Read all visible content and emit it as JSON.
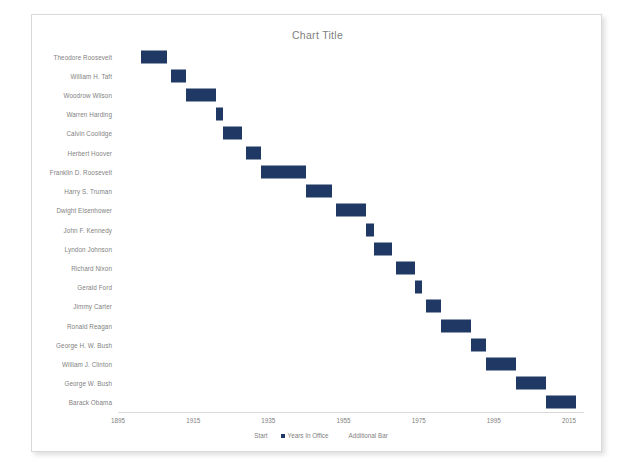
{
  "chart_data": {
    "type": "bar",
    "subtype": "stacked-horizontal-gantt",
    "title": "Chart Title",
    "xlabel": "",
    "ylabel": "",
    "xlim": [
      1895,
      2019
    ],
    "xticks": [
      1895,
      1915,
      1935,
      1955,
      1975,
      1995,
      2015
    ],
    "xtick_labels": [
      "1895",
      "1915",
      "1935",
      "1955",
      "1975",
      "1995",
      "2015"
    ],
    "grid": false,
    "legend_position": "bottom",
    "bar_color": "#1f3864",
    "categories": [
      "Theodore Roosevelt",
      "William H. Taft",
      "Woodrow Wilson",
      "Warren Harding",
      "Calvin Coolidge",
      "Herbert Hoover",
      "Franklin D. Roosevelt",
      "Harry S. Truman",
      "Dwight Eisenhower",
      "John F. Kennedy",
      "Lyndon Johnson",
      "Richard Nixon",
      "Gerald Ford",
      "Jimmy Carter",
      "Ronald Reagan",
      "George H. W. Bush",
      "William J. Clinton",
      "George W. Bush",
      "Barack Obama"
    ],
    "series": [
      {
        "name": "Start",
        "visible": false,
        "values": [
          1901,
          1909,
          1913,
          1921,
          1923,
          1929,
          1933,
          1945,
          1953,
          1961,
          1963,
          1969,
          1974,
          1977,
          1981,
          1989,
          1993,
          2001,
          2009
        ]
      },
      {
        "name": "Years In Office",
        "visible": true,
        "values": [
          7,
          4,
          8,
          2,
          5,
          4,
          12,
          7,
          8,
          2,
          5,
          5,
          2,
          4,
          8,
          4,
          8,
          8,
          8
        ]
      },
      {
        "name": "Additional Bar",
        "visible": false,
        "values": [
          0,
          0,
          0,
          0,
          0,
          0,
          0,
          0,
          0,
          0,
          0,
          0,
          0,
          0,
          0,
          0,
          0,
          0,
          0
        ]
      }
    ],
    "bars": [
      {
        "label": "Theodore Roosevelt",
        "start": 1901,
        "duration": 7
      },
      {
        "label": "William H. Taft",
        "start": 1909,
        "duration": 4
      },
      {
        "label": "Woodrow Wilson",
        "start": 1913,
        "duration": 8
      },
      {
        "label": "Warren Harding",
        "start": 1921,
        "duration": 2
      },
      {
        "label": "Calvin Coolidge",
        "start": 1923,
        "duration": 5
      },
      {
        "label": "Herbert Hoover",
        "start": 1929,
        "duration": 4
      },
      {
        "label": "Franklin D. Roosevelt",
        "start": 1933,
        "duration": 12
      },
      {
        "label": "Harry S. Truman",
        "start": 1945,
        "duration": 7
      },
      {
        "label": "Dwight Eisenhower",
        "start": 1953,
        "duration": 8
      },
      {
        "label": "John F. Kennedy",
        "start": 1961,
        "duration": 2
      },
      {
        "label": "Lyndon Johnson",
        "start": 1963,
        "duration": 5
      },
      {
        "label": "Richard Nixon",
        "start": 1969,
        "duration": 5
      },
      {
        "label": "Gerald Ford",
        "start": 1974,
        "duration": 2
      },
      {
        "label": "Jimmy Carter",
        "start": 1977,
        "duration": 4
      },
      {
        "label": "Ronald Reagan",
        "start": 1981,
        "duration": 8
      },
      {
        "label": "George H. W. Bush",
        "start": 1989,
        "duration": 4
      },
      {
        "label": "William J. Clinton",
        "start": 1993,
        "duration": 8
      },
      {
        "label": "George W. Bush",
        "start": 2001,
        "duration": 8
      },
      {
        "label": "Barack Obama",
        "start": 2009,
        "duration": 8
      }
    ],
    "legend": [
      {
        "label": "Start",
        "swatch": false,
        "color": "#1f3864"
      },
      {
        "label": "Years In Office",
        "swatch": true,
        "color": "#1f3864"
      },
      {
        "label": "Additional Bar",
        "swatch": false,
        "color": "#1f3864"
      }
    ]
  }
}
